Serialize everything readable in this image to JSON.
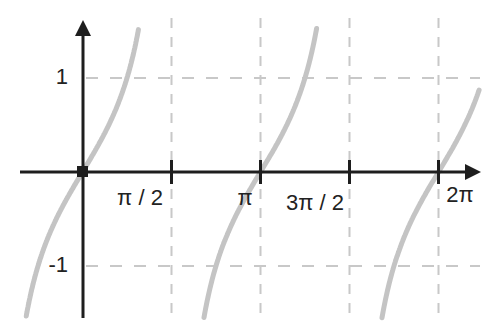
{
  "chart_data": {
    "type": "line",
    "title": "",
    "function": "tan(x)",
    "xlabel": "",
    "ylabel": "",
    "x_ticks": [
      {
        "value": 1.5708,
        "label": "π / 2"
      },
      {
        "value": 3.1416,
        "label": "π"
      },
      {
        "value": 4.7124,
        "label": "3π / 2"
      },
      {
        "value": 6.2832,
        "label": "2π"
      }
    ],
    "y_ticks": [
      {
        "value": 1,
        "label": "1"
      },
      {
        "value": -1,
        "label": "-1"
      }
    ],
    "xlim": [
      -1.1,
      7.0
    ],
    "ylim": [
      -1.55,
      1.6
    ],
    "grid": {
      "style": "dashed",
      "x_at": [
        1.5708,
        3.1416,
        4.7124,
        6.2832
      ],
      "y_at": [
        1,
        -1
      ]
    },
    "series": [
      {
        "name": "tan(x) branch 1",
        "x_range": [
          -1.1,
          1.43
        ],
        "sample_points": [
          [
            -1.1,
            -1.96
          ],
          [
            -0.785,
            -1
          ],
          [
            0,
            0
          ],
          [
            0.785,
            1
          ],
          [
            1.43,
            7.0
          ]
        ]
      },
      {
        "name": "tan(x) branch 2",
        "x_range": [
          1.72,
          4.55
        ],
        "sample_points": [
          [
            1.72,
            -6.7
          ],
          [
            2.356,
            -1
          ],
          [
            3.1416,
            0
          ],
          [
            3.927,
            1
          ],
          [
            4.55,
            7.0
          ]
        ]
      },
      {
        "name": "tan(x) branch 3",
        "x_range": [
          4.87,
          7.0
        ],
        "sample_points": [
          [
            4.87,
            -6.2
          ],
          [
            5.498,
            -1
          ],
          [
            6.2832,
            0
          ],
          [
            7.0,
            0.87
          ]
        ]
      }
    ],
    "legend": null,
    "origin_marker": true
  },
  "colors": {
    "axis": "#1e1e1e",
    "curve": "#c4c4c4",
    "grid": "#c8c8c8",
    "text": "#222222"
  }
}
